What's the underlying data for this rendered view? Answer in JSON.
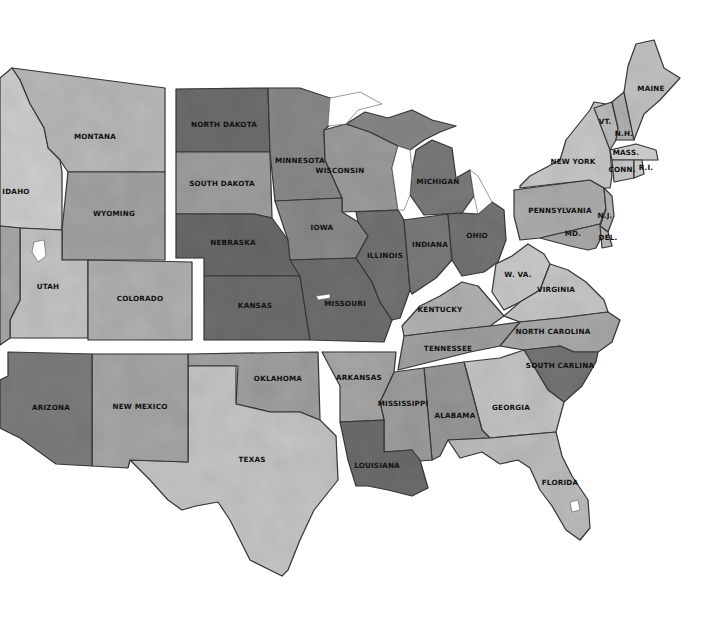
{
  "map": {
    "title": "United States watercolor map",
    "background": "#ffffff",
    "states": [
      {
        "id": "montana",
        "label": "MONTANA",
        "fill": "#b9b9b9",
        "points": "12,68 165,88 165,172 68,172 60,160 48,148 44,128 30,104 20,80",
        "lx": 95,
        "ly": 139
      },
      {
        "id": "idaho",
        "label": "IDAHO",
        "fill": "#cfcfcf",
        "points": "0,78 12,68 20,80 30,104 44,128 48,148 60,160 62,172 62,230 20,228 0,226",
        "lx": 16,
        "ly": 194
      },
      {
        "id": "wyoming",
        "label": "WYOMING",
        "fill": "#a4a4a4",
        "points": "68,172 165,172 165,260 62,260 62,230",
        "lx": 114,
        "ly": 216
      },
      {
        "id": "utah",
        "label": "UTAH",
        "fill": "#c4c4c4",
        "points": "20,228 62,230 62,260 88,260 88,338 10,338 10,320 20,300",
        "lx": 48,
        "ly": 289
      },
      {
        "id": "colorado",
        "label": "COLORADO",
        "fill": "#b1b1b1",
        "points": "88,260 192,262 192,340 88,340",
        "lx": 140,
        "ly": 301
      },
      {
        "id": "nevada",
        "label": "",
        "fill": "#a9a9a9",
        "points": "0,226 20,228 20,300 10,320 10,338 0,345",
        "lx": 0,
        "ly": 0
      },
      {
        "id": "north-dakota",
        "label": "NORTH DAKOTA",
        "fill": "#6e6e6e",
        "points": "176,89 268,88 270,152 176,152",
        "lx": 224,
        "ly": 127
      },
      {
        "id": "south-dakota",
        "label": "SOUTH DAKOTA",
        "fill": "#a0a0a0",
        "points": "176,152 270,152 272,218 254,214 176,214",
        "lx": 222,
        "ly": 186
      },
      {
        "id": "nebraska",
        "label": "NEBRASKA",
        "fill": "#6a6a6a",
        "points": "176,214 254,214 272,218 288,240 300,276 204,276 204,258 176,258",
        "lx": 233,
        "ly": 245
      },
      {
        "id": "kansas",
        "label": "KANSAS",
        "fill": "#6e6e6e",
        "points": "204,276 300,276 310,340 204,340",
        "lx": 255,
        "ly": 308
      },
      {
        "id": "minnesota",
        "label": "MINNESOTA",
        "fill": "#8a8a8a",
        "points": "268,88 300,88 330,98 352,100 330,125 324,130 325,160 342,198 275,201 270,152",
        "lx": 300,
        "ly": 163
      },
      {
        "id": "wisconsin",
        "label": "WISCONSIN",
        "fill": "#9d9d9d",
        "points": "324,130 346,124 370,132 398,146 392,168 398,210 342,212 342,198 325,160",
        "lx": 340,
        "ly": 173
      },
      {
        "id": "iowa",
        "label": "IOWA",
        "fill": "#8b8b8b",
        "points": "275,201 342,198 342,212 358,222 368,236 356,258 290,260 288,240",
        "lx": 322,
        "ly": 230
      },
      {
        "id": "missouri",
        "label": "MISSOURI",
        "fill": "#707070",
        "points": "290,260 356,258 372,282 380,302 392,320 384,342 310,340 300,276",
        "lx": 345,
        "ly": 306
      },
      {
        "id": "illinois",
        "label": "ILLINOIS",
        "fill": "#737373",
        "points": "356,212 398,210 404,220 410,290 400,318 392,320 380,302 372,282 356,258 368,236 358,222",
        "lx": 385,
        "ly": 258
      },
      {
        "id": "michigan-up",
        "label": "",
        "fill": "#878787",
        "points": "346,124 365,112 388,118 412,110 432,120 456,126 440,132 424,140 410,150 398,146 370,132",
        "lx": 0,
        "ly": 0
      },
      {
        "id": "michigan",
        "label": "MICHIGAN",
        "fill": "#7a7a7a",
        "points": "416,150 432,140 452,148 456,178 470,170 474,196 462,213 424,215 410,195 412,170",
        "lx": 438,
        "ly": 184
      },
      {
        "id": "indiana",
        "label": "INDIANA",
        "fill": "#7b7b7b",
        "points": "404,220 448,214 452,260 436,278 412,294 410,290",
        "lx": 430,
        "ly": 247
      },
      {
        "id": "ohio",
        "label": "OHIO",
        "fill": "#757575",
        "points": "448,214 462,213 478,214 492,202 504,210 506,240 498,262 484,272 462,276 452,260",
        "lx": 477,
        "ly": 238
      },
      {
        "id": "kentucky",
        "label": "KENTUCKY",
        "fill": "#b2b2b2",
        "points": "402,326 420,306 440,296 462,282 478,286 490,300 504,316 490,326 436,332 404,336",
        "lx": 440,
        "ly": 312
      },
      {
        "id": "tennessee",
        "label": "TENNESSEE",
        "fill": "#a1a1a1",
        "points": "404,336 436,332 490,326 520,322 500,346 470,352 398,370",
        "lx": 448,
        "ly": 351
      },
      {
        "id": "west-virginia",
        "label": "W. VA.",
        "fill": "#cbcbcb",
        "points": "496,264 512,256 528,244 544,254 550,264 540,290 520,302 504,310 492,292",
        "lx": 518,
        "ly": 277
      },
      {
        "id": "virginia",
        "label": "VIRGINIA",
        "fill": "#c8c8c8",
        "points": "504,316 520,302 540,290 550,264 568,270 586,282 604,300 608,312 560,318 520,322",
        "lx": 556,
        "ly": 292
      },
      {
        "id": "north-carolina",
        "label": "NORTH CAROLINA",
        "fill": "#aaaaaa",
        "points": "500,346 520,322 560,318 608,312 620,320 612,342 598,352 574,352 560,346 524,350",
        "lx": 553,
        "ly": 334
      },
      {
        "id": "south-carolina",
        "label": "SOUTH CARLINA",
        "fill": "#767676",
        "points": "524,350 560,346 574,352 598,352 596,362 582,386 564,402 548,390",
        "lx": 560,
        "ly": 368
      },
      {
        "id": "georgia",
        "label": "GEORGIA",
        "fill": "#c5c5c5",
        "points": "464,362 500,358 524,350 548,390 564,402 556,432 490,438 482,430",
        "lx": 511,
        "ly": 410
      },
      {
        "id": "alabama",
        "label": "ALABAMA",
        "fill": "#989898",
        "points": "424,368 464,362 482,430 490,438 448,440 440,456 432,460",
        "lx": 455,
        "ly": 418
      },
      {
        "id": "mississippi",
        "label": "MISSISSIPPI",
        "fill": "#9f9f9f",
        "points": "394,372 424,368 432,460 408,462 412,450 384,452 384,420 380,402",
        "lx": 403,
        "ly": 406
      },
      {
        "id": "florida",
        "label": "FLORIDA",
        "fill": "#bebebe",
        "points": "448,440 490,438 556,432 562,456 572,476 588,500 590,528 580,540 566,530 552,506 540,490 530,468 518,460 500,464 482,452 460,458",
        "lx": 560,
        "ly": 485
      },
      {
        "id": "arkansas",
        "label": "ARKANSAS",
        "fill": "#a7a7a7",
        "points": "322,352 396,352 394,372 380,402 384,420 340,422 340,386",
        "lx": 359,
        "ly": 380
      },
      {
        "id": "louisiana",
        "label": "LOUISIANA",
        "fill": "#6d6d6d",
        "points": "340,422 384,420 384,452 412,450 420,460 428,488 412,496 388,490 368,486 356,486 348,460",
        "lx": 377,
        "ly": 468
      },
      {
        "id": "oklahoma",
        "label": "OKLAHOMA",
        "fill": "#a1a1a1",
        "points": "188,354 318,352 320,420 300,412 270,412 236,404 238,366 188,366",
        "lx": 278,
        "ly": 381
      },
      {
        "id": "texas",
        "label": "TEXAS",
        "fill": "#c6c6c6",
        "points": "188,366 236,366 236,404 270,412 300,412 320,420 336,436 338,480 330,490 314,510 300,540 288,570 282,576 250,560 230,520 218,502 196,506 182,510 168,500 150,480 130,460 188,462",
        "lx": 252,
        "ly": 462
      },
      {
        "id": "new-mexico",
        "label": "NEW MEXICO",
        "fill": "#a7a7a7",
        "points": "92,354 188,354 188,462 130,460 128,468 92,466",
        "lx": 140,
        "ly": 409
      },
      {
        "id": "arizona",
        "label": "ARIZONA",
        "fill": "#7e7e7e",
        "points": "8,352 92,354 92,466 56,464 20,438 0,428 0,380 8,376",
        "lx": 51,
        "ly": 410
      },
      {
        "id": "pennsylvania",
        "label": "PENNSYLVANIA",
        "fill": "#aeaeae",
        "points": "514,190 590,180 604,188 606,208 600,224 540,238 520,240 514,216",
        "lx": 560,
        "ly": 213
      },
      {
        "id": "new-york",
        "label": "NEW YORK",
        "fill": "#c9c9c9",
        "points": "520,186 530,176 560,160 566,140 590,110 594,102 606,104 610,150 612,176 610,188 604,188 590,180 520,188",
        "lx": 573,
        "ly": 164
      },
      {
        "id": "new-jersey",
        "label": "N.J.",
        "fill": "#b5b5b5",
        "points": "604,188 612,196 614,216 608,232 600,226 606,210",
        "lx": 605,
        "ly": 218
      },
      {
        "id": "maryland",
        "label": "MD.",
        "fill": "#a9a9a9",
        "points": "540,238 600,224 602,236 596,248 588,250 570,246",
        "lx": 573,
        "ly": 236
      },
      {
        "id": "delaware",
        "label": "DEL.",
        "fill": "#bebebe",
        "points": "600,226 608,232 612,246 602,248",
        "lx": 608,
        "ly": 240
      },
      {
        "id": "vermont",
        "label": "VT.",
        "fill": "#bdbdbd",
        "points": "594,108 612,102 618,128 616,140 610,150",
        "lx": 605,
        "ly": 124
      },
      {
        "id": "new-hampshire",
        "label": "N.H.",
        "fill": "#b3b3b3",
        "points": "612,102 624,92 634,140 616,140 618,128",
        "lx": 624,
        "ly": 136
      },
      {
        "id": "maine",
        "label": "MAINE",
        "fill": "#c2c2c2",
        "points": "624,92 628,66 636,44 654,40 664,68 680,78 660,100 644,114 634,140",
        "lx": 651,
        "ly": 91
      },
      {
        "id": "massachusetts",
        "label": "MASS.",
        "fill": "#d2d2d2",
        "points": "610,150 636,144 656,150 658,160 612,160",
        "lx": 626,
        "ly": 155
      },
      {
        "id": "connecticut",
        "label": "CONN.",
        "fill": "#c8c8c8",
        "points": "612,160 634,160 634,178 614,182",
        "lx": 622,
        "ly": 172
      },
      {
        "id": "rhode-island",
        "label": "R.I.",
        "fill": "#cfcfcf",
        "points": "634,160 642,160 644,174 634,178",
        "lx": 646,
        "ly": 170
      }
    ],
    "lakes": [
      {
        "id": "lake-superior",
        "points": "330,98 360,92 382,104 358,110 346,124 328,126"
      },
      {
        "id": "lake-michigan",
        "points": "398,146 410,150 412,170 410,195 404,210 398,210 392,168"
      },
      {
        "id": "lake-erie",
        "points": "470,170 478,176 492,202 478,214 474,196"
      },
      {
        "id": "great-salt-lake",
        "points": "34,242 44,240 46,256 38,262 32,252"
      },
      {
        "id": "lake-okeechobee",
        "points": "570,502 578,500 580,510 572,512"
      },
      {
        "id": "lake-ozarks",
        "points": "316,296 330,294 330,298 318,300"
      }
    ]
  }
}
